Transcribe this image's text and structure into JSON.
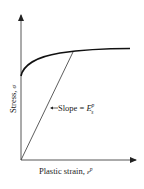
{
  "diagram": {
    "type": "stress-strain curve with secant modulus",
    "x_axis": {
      "label": "Plastic strain, ",
      "symbol": "ε",
      "superscript": "p"
    },
    "y_axis": {
      "label": "Stress, ",
      "symbol": "σ"
    },
    "annotation": {
      "prefix": "Slope = ",
      "symbol": "E",
      "subscript": "s",
      "superscript": "p"
    },
    "colors": {
      "ink": "#222222",
      "background": "#ffffff"
    }
  }
}
